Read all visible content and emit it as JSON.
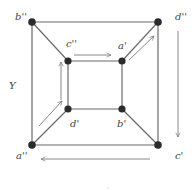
{
  "diagram": {
    "type": "graph",
    "colors": {
      "edge": "#6b6b6b",
      "vertex": "#2b2b2b",
      "arrow": "#7a7a7a",
      "label": "#444444"
    },
    "vertices": [
      {
        "id": "b2",
        "label": "b''",
        "x": 32,
        "y": 22
      },
      {
        "id": "d2",
        "label": "d''",
        "x": 158,
        "y": 22
      },
      {
        "id": "a2",
        "label": "a''",
        "x": 32,
        "y": 145
      },
      {
        "id": "c1",
        "label": "c'",
        "x": 158,
        "y": 145
      },
      {
        "id": "c2",
        "label": "c''",
        "x": 68,
        "y": 61
      },
      {
        "id": "a1",
        "label": "a'",
        "x": 122,
        "y": 61
      },
      {
        "id": "d1",
        "label": "d'",
        "x": 68,
        "y": 109
      },
      {
        "id": "b1",
        "label": "b'",
        "x": 122,
        "y": 109
      }
    ],
    "edges": [
      [
        "b''",
        "d''"
      ],
      [
        "d''",
        "c'"
      ],
      [
        "c'",
        "a''"
      ],
      [
        "a''",
        "b''"
      ],
      [
        "c''",
        "a'"
      ],
      [
        "a'",
        "b'"
      ],
      [
        "b'",
        "d'"
      ],
      [
        "d'",
        "c''"
      ],
      [
        "b''",
        "c''"
      ],
      [
        "d''",
        "a'"
      ],
      [
        "c'",
        "b'"
      ],
      [
        "a''",
        "d'"
      ]
    ],
    "arrows": [
      {
        "from": "a''",
        "to": "d'",
        "label": "parallel to a''-d' edge"
      },
      {
        "from": "d'",
        "to": "c''",
        "label": "parallel to d'-c'' edge, upward"
      },
      {
        "from": "c''",
        "to": "a'",
        "label": "parallel to c''-a' edge, rightward"
      },
      {
        "from": "a'",
        "to": "d''",
        "label": "parallel to a'-d'' edge"
      },
      {
        "from": "d''",
        "to": "c'",
        "label": "right side, downward"
      },
      {
        "from": "c'",
        "to": "a''",
        "label": "bottom, leftward"
      }
    ],
    "labels": {
      "b2": "b''",
      "d2": "d''",
      "a2": "a''",
      "c1": "c'",
      "c2": "c''",
      "a1": "a'",
      "d1": "d'",
      "b1": "b'",
      "region": "Y"
    }
  }
}
